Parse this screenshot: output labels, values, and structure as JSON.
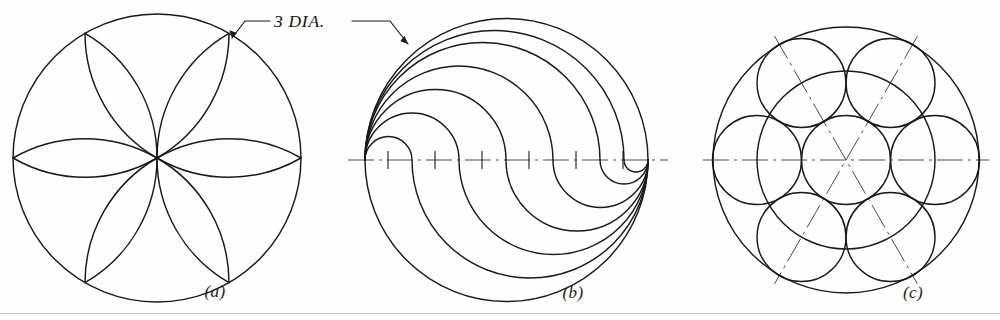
{
  "sheet": {
    "title": "Geometric construction exercises",
    "width": 1000,
    "height": 320,
    "background_color": "#fefefe",
    "ink_color": "#1a1a1a",
    "centerline_color": "#4a4a4a",
    "footer_rule_color": "#c9c9c9"
  },
  "annotations": {
    "dimension_label": "3 DIA."
  },
  "figures": [
    {
      "id": "a",
      "label": "(a)",
      "name": "six-petal-rosette",
      "center": {
        "x": 157,
        "y": 158
      },
      "radius": 144,
      "petal_count": 6,
      "arc_count": 12,
      "label_pos": {
        "x": 215,
        "y": 297
      }
    },
    {
      "id": "b",
      "label": "(b)",
      "name": "nested-ogee-spiral",
      "center": {
        "x": 506,
        "y": 160
      },
      "radius": 141,
      "curve_count": 6,
      "centerline_ticks": 6,
      "label_pos": {
        "x": 573,
        "y": 298
      }
    },
    {
      "id": "c",
      "label": "(c)",
      "name": "seven-circle-rosette",
      "center": {
        "x": 846,
        "y": 160
      },
      "radius": 133,
      "inner_radius": 89,
      "small_circle_radius": 44.5,
      "small_circle_count": 7,
      "centerline_angles_deg": [
        0,
        60,
        120
      ],
      "label_pos": {
        "x": 913,
        "y": 298
      }
    }
  ]
}
